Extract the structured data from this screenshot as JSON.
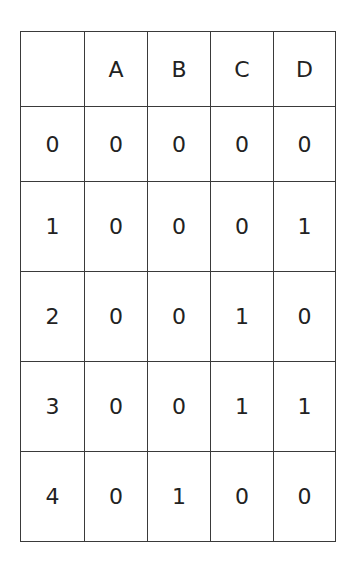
{
  "table": {
    "headers": [
      "",
      "A",
      "B",
      "C",
      "D"
    ],
    "rows": [
      [
        "0",
        "0",
        "0",
        "0",
        "0"
      ],
      [
        "1",
        "0",
        "0",
        "0",
        "1"
      ],
      [
        "2",
        "0",
        "0",
        "1",
        "0"
      ],
      [
        "3",
        "0",
        "0",
        "1",
        "1"
      ],
      [
        "4",
        "0",
        "1",
        "0",
        "0"
      ]
    ]
  }
}
